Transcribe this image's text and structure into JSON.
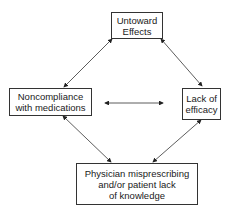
{
  "diagram": {
    "nodes": {
      "top": {
        "label": "Untoward\nEffects"
      },
      "left": {
        "label": "Noncompliance\nwith medications"
      },
      "right": {
        "label": "Lack of\nefficacy"
      },
      "bottom": {
        "label": "Physician misprescribing\nand/or patient lack\nof knowledge"
      }
    },
    "edges": [
      {
        "from": "top",
        "to": "left",
        "type": "bidirectional"
      },
      {
        "from": "top",
        "to": "right",
        "type": "bidirectional"
      },
      {
        "from": "left",
        "to": "bottom",
        "type": "bidirectional"
      },
      {
        "from": "right",
        "to": "bottom",
        "type": "bidirectional"
      },
      {
        "from": "left",
        "to": "right",
        "type": "bidirectional"
      }
    ],
    "colors": {
      "stroke": "#333333",
      "background": "#ffffff"
    }
  }
}
